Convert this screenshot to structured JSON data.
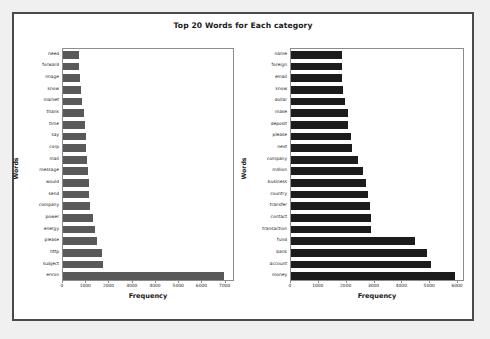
{
  "figure": {
    "title": "Top 20 Words for Each category",
    "background_color": "#ffffff",
    "page_color": "#f0f0f0",
    "border_color": "#4a4a4a"
  },
  "chart_data": [
    {
      "type": "bar",
      "orientation": "horizontal",
      "subplot": "left",
      "title": "",
      "xlabel": "Frequency",
      "ylabel": "Words",
      "xlim": [
        0,
        7400
      ],
      "xticks": [
        0,
        1000,
        2000,
        3000,
        4000,
        5000,
        6000,
        7000
      ],
      "grid": false,
      "bar_color": "#595959",
      "categories": [
        "need",
        "forward",
        "image",
        "know",
        "market",
        "thank",
        "time",
        "say",
        "corp",
        "mail",
        "message",
        "would",
        "send",
        "company",
        "power",
        "energy",
        "please",
        "http",
        "subject",
        "enron"
      ],
      "values": [
        700,
        715,
        740,
        790,
        830,
        910,
        940,
        990,
        1020,
        1040,
        1080,
        1120,
        1140,
        1170,
        1320,
        1400,
        1500,
        1680,
        1720,
        7000
      ]
    },
    {
      "type": "bar",
      "orientation": "horizontal",
      "subplot": "right",
      "title": "",
      "xlabel": "Frequency",
      "ylabel": "Words",
      "xlim": [
        0,
        6250
      ],
      "xticks": [
        0,
        1000,
        2000,
        3000,
        4000,
        5000,
        6000
      ],
      "grid": false,
      "bar_color": "#1c1c1c",
      "categories": [
        "name",
        "foreign",
        "email",
        "know",
        "dollar",
        "make",
        "deposit",
        "please",
        "next",
        "company",
        "million",
        "business",
        "country",
        "transfer",
        "contact",
        "transaction",
        "fund",
        "bank",
        "account",
        "money"
      ],
      "values": [
        1840,
        1850,
        1870,
        1900,
        1960,
        2060,
        2070,
        2180,
        2220,
        2450,
        2620,
        2720,
        2790,
        2880,
        2900,
        2920,
        4500,
        4950,
        5100,
        5950
      ]
    }
  ]
}
